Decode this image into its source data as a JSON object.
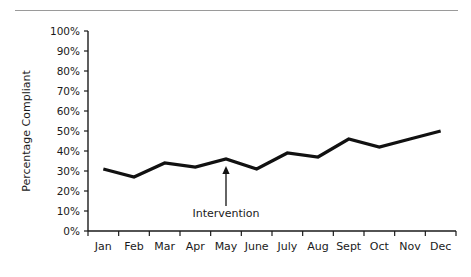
{
  "figure": {
    "top_rule": "horizontal-rule",
    "background_color": "#ffffff",
    "line_color": "#111111"
  },
  "chart_data": {
    "type": "line",
    "title": "",
    "xlabel": "",
    "ylabel": "Percentage Compliant",
    "categories": [
      "Jan",
      "Feb",
      "Mar",
      "Apr",
      "May",
      "June",
      "July",
      "Aug",
      "Sept",
      "Oct",
      "Nov",
      "Dec"
    ],
    "values": [
      31,
      27,
      34,
      32,
      36,
      31,
      39,
      37,
      46,
      42,
      46,
      50
    ],
    "series": [
      {
        "name": "Percentage Compliant",
        "values": [
          31,
          27,
          34,
          32,
          36,
          31,
          39,
          37,
          46,
          42,
          46,
          50
        ]
      }
    ],
    "ylim": [
      0,
      100
    ],
    "ytick_values": [
      0,
      10,
      20,
      30,
      40,
      50,
      60,
      70,
      80,
      90,
      100
    ],
    "ytick_labels": [
      "0%",
      "10%",
      "20%",
      "30%",
      "40%",
      "50%",
      "60%",
      "70%",
      "80%",
      "90%",
      "100%"
    ],
    "grid": false,
    "legend": false,
    "legend_position": "none",
    "annotations": [
      {
        "label": "Intervention",
        "at_category": "May",
        "at_value": 36,
        "arrow": "up-arrow"
      }
    ]
  }
}
